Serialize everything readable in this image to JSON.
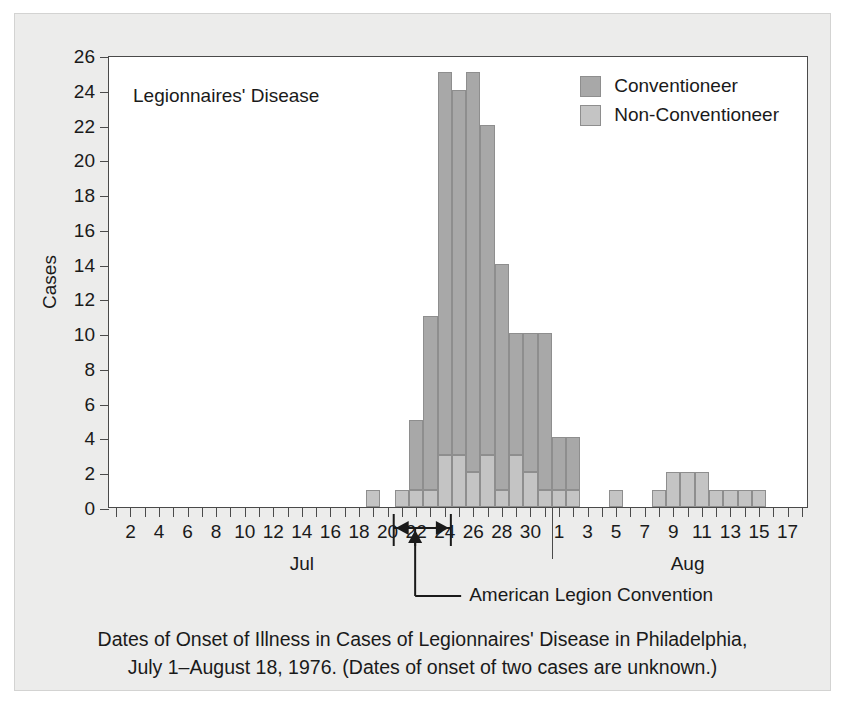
{
  "figure": {
    "plot_title": "Legionnaires' Disease",
    "y_axis_title": "Cases",
    "caption_line1": "Dates of Onset of Illness in Cases of Legionnaires' Disease in Philadelphia,",
    "caption_line2": "July 1–August 18, 1976. (Dates of onset of two cases are unknown.)"
  },
  "legend": {
    "position": "top-right",
    "items": [
      {
        "label": "Conventioneer",
        "color": "#a8a8a8"
      },
      {
        "label": "Non-Conventioneer",
        "color": "#c4c4c4"
      }
    ]
  },
  "annotation": {
    "convention_label": "American Legion Convention",
    "bracket_start_day": "Jul 21",
    "bracket_end_day": "Jul 24",
    "arrow_day": "Jul 22"
  },
  "axis": {
    "y_ticks": [
      0,
      2,
      4,
      6,
      8,
      10,
      12,
      14,
      16,
      18,
      20,
      22,
      24,
      26
    ],
    "y_min": 0,
    "y_max": 26,
    "x_month_labels": [
      "Jul",
      "Aug"
    ],
    "x_tick_labels_july": [
      2,
      4,
      6,
      8,
      10,
      12,
      14,
      16,
      18,
      20,
      22,
      24,
      26,
      28,
      30
    ],
    "x_tick_labels_august": [
      1,
      3,
      5,
      7,
      9,
      11,
      13,
      15,
      17
    ]
  },
  "chart_data": {
    "type": "bar",
    "title": "Legionnaires' Disease",
    "subtitle": "Dates of Onset of Illness in Cases of Legionnaires' Disease in Philadelphia, July 1–August 18, 1976. (Dates of onset of two cases are unknown.)",
    "xlabel": "",
    "ylabel": "Cases",
    "ylim": [
      0,
      26
    ],
    "grid": false,
    "stacked": true,
    "legend_position": "top-right",
    "categories": [
      "Jul 1",
      "Jul 2",
      "Jul 3",
      "Jul 4",
      "Jul 5",
      "Jul 6",
      "Jul 7",
      "Jul 8",
      "Jul 9",
      "Jul 10",
      "Jul 11",
      "Jul 12",
      "Jul 13",
      "Jul 14",
      "Jul 15",
      "Jul 16",
      "Jul 17",
      "Jul 18",
      "Jul 19",
      "Jul 20",
      "Jul 21",
      "Jul 22",
      "Jul 23",
      "Jul 24",
      "Jul 25",
      "Jul 26",
      "Jul 27",
      "Jul 28",
      "Jul 29",
      "Jul 30",
      "Jul 31",
      "Aug 1",
      "Aug 2",
      "Aug 3",
      "Aug 4",
      "Aug 5",
      "Aug 6",
      "Aug 7",
      "Aug 8",
      "Aug 9",
      "Aug 10",
      "Aug 11",
      "Aug 12",
      "Aug 13",
      "Aug 14",
      "Aug 15",
      "Aug 16",
      "Aug 17",
      "Aug 18"
    ],
    "series": [
      {
        "name": "Conventioneer",
        "color": "#a8a8a8",
        "values": [
          0,
          0,
          0,
          0,
          0,
          0,
          0,
          0,
          0,
          0,
          0,
          0,
          0,
          0,
          0,
          0,
          0,
          0,
          0,
          0,
          0,
          4,
          10,
          22,
          21,
          23,
          19,
          13,
          7,
          8,
          9,
          3,
          3,
          0,
          0,
          0,
          0,
          0,
          0,
          0,
          0,
          0,
          0,
          0,
          0,
          0,
          0,
          0,
          0
        ]
      },
      {
        "name": "Non-Conventioneer",
        "color": "#c4c4c4",
        "values": [
          0,
          0,
          0,
          0,
          0,
          0,
          0,
          0,
          0,
          0,
          0,
          0,
          0,
          0,
          0,
          0,
          0,
          0,
          1,
          0,
          1,
          1,
          1,
          3,
          3,
          2,
          3,
          1,
          3,
          2,
          1,
          1,
          1,
          0,
          0,
          1,
          0,
          0,
          1,
          2,
          2,
          2,
          1,
          1,
          1,
          1,
          0,
          0,
          0
        ]
      }
    ],
    "totals": [
      0,
      0,
      0,
      0,
      0,
      0,
      0,
      0,
      0,
      0,
      0,
      0,
      0,
      0,
      0,
      0,
      0,
      0,
      1,
      0,
      1,
      5,
      11,
      25,
      24,
      25,
      22,
      14,
      10,
      10,
      10,
      4,
      4,
      0,
      0,
      1,
      0,
      0,
      1,
      2,
      2,
      2,
      1,
      1,
      1,
      1,
      0,
      0,
      0
    ]
  }
}
